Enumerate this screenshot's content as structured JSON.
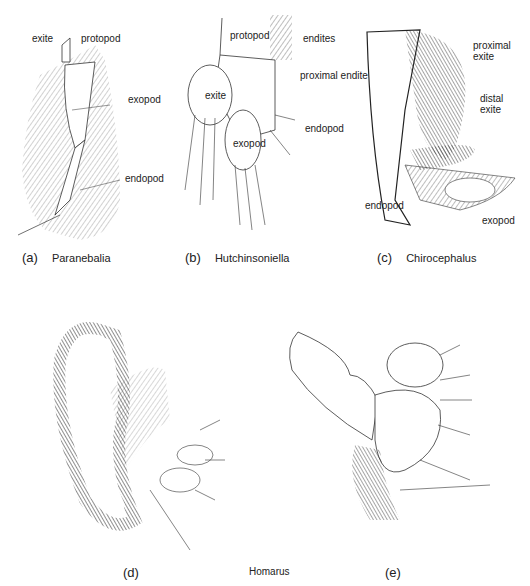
{
  "figure": {
    "panels": [
      {
        "id": "a",
        "caption_letter": "(a)",
        "genus": "Paranebalia",
        "labels": [
          "exite",
          "protopod",
          "exopod",
          "endopod"
        ]
      },
      {
        "id": "b",
        "caption_letter": "(b)",
        "genus": "Hutchinsoniella",
        "labels": [
          "protopod",
          "endites",
          "exite",
          "exopod",
          "endopod"
        ]
      },
      {
        "id": "c",
        "caption_letter": "(c)",
        "genus": "Chirocephalus",
        "labels": [
          "proximal endite",
          "proximal exite",
          "distal exite",
          "endopod",
          "exopod"
        ],
        "label_lines": {
          "proximal_exite": [
            "proximal",
            "exite"
          ],
          "distal_exite": [
            "distal",
            "exite"
          ]
        }
      },
      {
        "id": "d",
        "caption_letter": "(d)"
      },
      {
        "id": "e",
        "caption_letter": "(e)"
      }
    ],
    "shared_caption_de": "Homarus"
  }
}
